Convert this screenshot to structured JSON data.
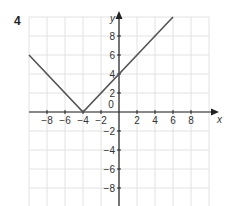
{
  "question_number": "4",
  "chart_data": {
    "type": "line",
    "title": "",
    "xlabel": "x",
    "ylabel": "y",
    "xlim": [
      -10,
      10
    ],
    "ylim": [
      -10,
      10
    ],
    "grid": true,
    "grid_step": 2,
    "x_tick_labels": [
      "-8",
      "-6",
      "-4",
      "-2",
      "0",
      "2",
      "4",
      "6",
      "8"
    ],
    "y_tick_labels": [
      "8",
      "6",
      "4",
      "2",
      "-2",
      "-4",
      "-6",
      "-8"
    ],
    "series": [
      {
        "name": "V-shaped graph",
        "x": [
          -10,
          -4,
          6
        ],
        "y": [
          6,
          0,
          10
        ],
        "color": "#555555"
      }
    ]
  },
  "colors": {
    "grid": "#e2e2e2",
    "axis": "#222222",
    "line": "#555555"
  }
}
